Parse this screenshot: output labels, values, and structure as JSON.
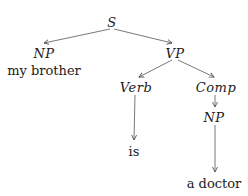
{
  "diagram": {
    "type": "syntax-tree",
    "nodes": [
      {
        "id": "S",
        "label": "S",
        "kind": "category",
        "x": 112,
        "y": 22
      },
      {
        "id": "NP1",
        "label": "NP",
        "kind": "category",
        "x": 44,
        "y": 53
      },
      {
        "id": "NP1_word",
        "label": "my brother",
        "kind": "word",
        "x": 44,
        "y": 70
      },
      {
        "id": "VP",
        "label": "VP",
        "kind": "category",
        "x": 175,
        "y": 53
      },
      {
        "id": "Verb",
        "label": "Verb",
        "kind": "category",
        "x": 136,
        "y": 87
      },
      {
        "id": "Comp",
        "label": "Comp",
        "kind": "category",
        "x": 216,
        "y": 87
      },
      {
        "id": "is",
        "label": "is",
        "kind": "word",
        "x": 134,
        "y": 151
      },
      {
        "id": "NP2",
        "label": "NP",
        "kind": "category",
        "x": 214,
        "y": 117
      },
      {
        "id": "a_doctor",
        "label": "a doctor",
        "kind": "word",
        "x": 214,
        "y": 183
      }
    ],
    "edges": [
      {
        "from": "S",
        "to": "NP1",
        "x1": 110,
        "y1": 29,
        "x2": 44,
        "y2": 43
      },
      {
        "from": "S",
        "to": "VP",
        "x1": 114,
        "y1": 29,
        "x2": 172,
        "y2": 43
      },
      {
        "from": "VP",
        "to": "Verb",
        "x1": 172,
        "y1": 60,
        "x2": 139,
        "y2": 77
      },
      {
        "from": "VP",
        "to": "Comp",
        "x1": 178,
        "y1": 60,
        "x2": 214,
        "y2": 77
      },
      {
        "from": "Verb",
        "to": "is",
        "x1": 135,
        "y1": 95,
        "x2": 134,
        "y2": 140
      },
      {
        "from": "Comp",
        "to": "NP2",
        "x1": 215,
        "y1": 95,
        "x2": 215,
        "y2": 107
      },
      {
        "from": "NP2",
        "to": "a_doctor",
        "x1": 215,
        "y1": 125,
        "x2": 215,
        "y2": 172
      }
    ],
    "colors": {
      "line": "#555555",
      "text": "#1a1a1a",
      "background": "#ffffff"
    }
  }
}
